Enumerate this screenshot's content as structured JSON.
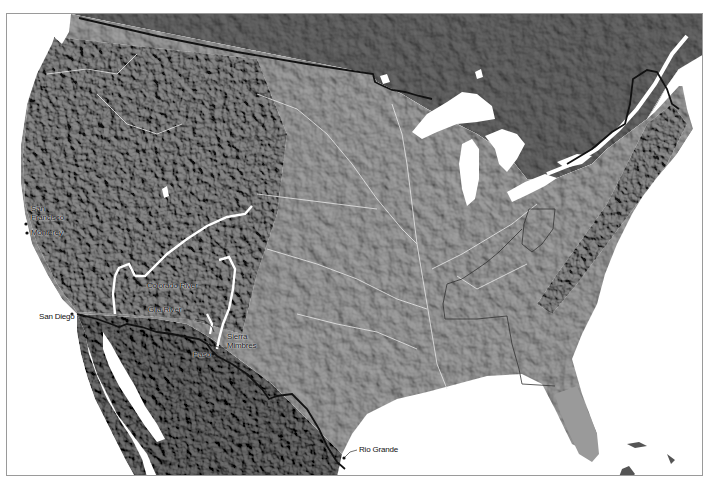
{
  "map": {
    "style": "grayscale shaded relief",
    "colors": {
      "water": "#ffffff",
      "canada_land": "#5e5e5e",
      "us_land": "#9c9c9c",
      "mexico_land": "#6a6a6a",
      "border_line": "#111111",
      "cession_outline": "#ffffff",
      "frame": "#9a9a9a"
    },
    "labels": [
      {
        "id": "san-francisco",
        "text_line1": "San",
        "text_line2": "Francisco"
      },
      {
        "id": "monterey",
        "text": "Monterey"
      },
      {
        "id": "san-diego",
        "text": "San Diego"
      },
      {
        "id": "colorado-river",
        "text": "Colorado River"
      },
      {
        "id": "gila-river",
        "text": "Gila River"
      },
      {
        "id": "sierra-mimbres",
        "text_line1": "Sierra",
        "text_line2": "Mimbres"
      },
      {
        "id": "paso",
        "text": "Paso"
      },
      {
        "id": "rio-grande",
        "text": "Rio Grande"
      }
    ]
  }
}
